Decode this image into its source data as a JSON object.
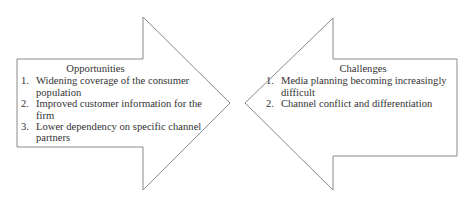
{
  "diagram": {
    "left_arrow": {
      "direction": "right",
      "title": "Opportunities",
      "items": [
        {
          "num": "1.",
          "text": "Widening coverage of the consumer population"
        },
        {
          "num": "2.",
          "text": "Improved customer information for the firm"
        },
        {
          "num": "3.",
          "text": "Lower dependency on specific channel partners"
        }
      ]
    },
    "right_arrow": {
      "direction": "left",
      "title": "Challenges",
      "items": [
        {
          "num": "1.",
          "text": "Media planning becoming increasingly difficult"
        },
        {
          "num": "2.",
          "text": "Channel conflict and differentiation"
        }
      ]
    },
    "colors": {
      "outline": "#8a8a8a",
      "text": "#333333",
      "background": "#ffffff"
    }
  }
}
